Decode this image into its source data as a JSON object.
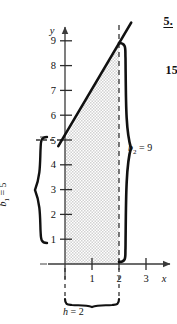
{
  "figure": {
    "type": "coordinate-graph-trapezoid",
    "axes": {
      "x_name": "x",
      "y_name": "y",
      "x_ticks": [
        "1",
        "2",
        "3"
      ],
      "x_tick_values": [
        1,
        2,
        3
      ],
      "y_ticks": [
        "1",
        "2",
        "3",
        "4",
        "5",
        "6",
        "7",
        "8",
        "9"
      ],
      "y_tick_values": [
        1,
        2,
        3,
        4,
        5,
        6,
        7,
        8,
        9
      ],
      "x_range": [
        -0.55,
        4.3
      ],
      "y_range": [
        -0.2,
        9.6
      ]
    },
    "line": {
      "slope": 2,
      "intercept": 5,
      "draw_from_x": -0.25,
      "draw_to_x": 2.45,
      "label": ""
    },
    "shaded_region": {
      "fill": "#e4e4e4",
      "vertices": [
        [
          0,
          0
        ],
        [
          0,
          5
        ],
        [
          2,
          9
        ],
        [
          2,
          0
        ]
      ]
    },
    "dashed_lines": [
      {
        "name": "y-intercept-guide",
        "orientation": "horizontal",
        "at": 5
      },
      {
        "name": "x-equals-2-guide",
        "orientation": "vertical",
        "at": 2
      }
    ],
    "braces": [
      {
        "name": "b1-brace",
        "side": "left",
        "label": "b",
        "sub": "1",
        "eq": " = 5",
        "value": 5
      },
      {
        "name": "b2-brace",
        "side": "right",
        "label": "b",
        "sub": "2",
        "eq": " = 9",
        "value": 9
      },
      {
        "name": "h-brace",
        "side": "bottom",
        "label": "h",
        "sub": "",
        "eq": " = 2",
        "value": 2
      }
    ]
  },
  "annotations": {
    "exercise_number": "5.",
    "page_number": "15"
  },
  "colors": {
    "ink": "#111111",
    "axis": "#3a3a3a",
    "shade": "#e4e4e4"
  }
}
